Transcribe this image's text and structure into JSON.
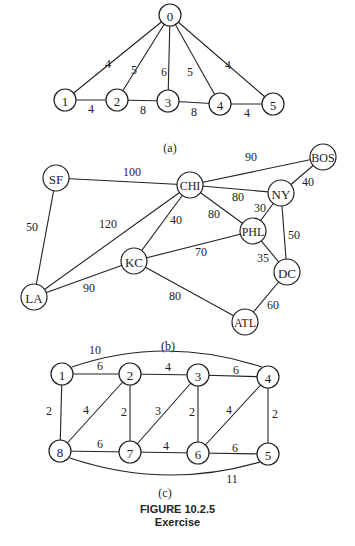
{
  "figure": {
    "title": "FIGURE 10.2.5",
    "subtitle": "Exercise"
  },
  "graph_a": {
    "caption": "(a)",
    "nodes": [
      {
        "id": "0",
        "x": 170,
        "y": 15
      },
      {
        "id": "1",
        "x": 65,
        "y": 100
      },
      {
        "id": "2",
        "x": 117,
        "y": 100
      },
      {
        "id": "3",
        "x": 168,
        "y": 101
      },
      {
        "id": "4",
        "x": 220,
        "y": 104
      },
      {
        "id": "5",
        "x": 273,
        "y": 104
      }
    ],
    "edges": [
      {
        "from": "0",
        "to": "1",
        "w": "4",
        "lx": 108,
        "ly": 64
      },
      {
        "from": "0",
        "to": "2",
        "w": "5",
        "lx": 134,
        "ly": 70
      },
      {
        "from": "0",
        "to": "3",
        "w": "6",
        "lx": 164,
        "ly": 72
      },
      {
        "from": "0",
        "to": "4",
        "w": "5",
        "lx": 190,
        "ly": 72
      },
      {
        "from": "0",
        "to": "5",
        "w": "4",
        "lx": 228,
        "ly": 65
      },
      {
        "from": "1",
        "to": "2",
        "w": "4",
        "lx": 91,
        "ly": 109
      },
      {
        "from": "2",
        "to": "3",
        "w": "8",
        "lx": 143,
        "ly": 110
      },
      {
        "from": "3",
        "to": "4",
        "w": "8",
        "lx": 194,
        "ly": 112
      },
      {
        "from": "4",
        "to": "5",
        "w": "4",
        "lx": 247,
        "ly": 113
      }
    ]
  },
  "graph_b": {
    "caption": "(b)",
    "nodes": [
      {
        "id": "SF",
        "x": 56,
        "y": 178
      },
      {
        "id": "CHI",
        "x": 190,
        "y": 185
      },
      {
        "id": "BOS",
        "x": 323,
        "y": 157
      },
      {
        "id": "NY",
        "x": 281,
        "y": 193
      },
      {
        "id": "PHL",
        "x": 253,
        "y": 231
      },
      {
        "id": "KC",
        "x": 134,
        "y": 261
      },
      {
        "id": "DC",
        "x": 287,
        "y": 272
      },
      {
        "id": "LA",
        "x": 34,
        "y": 297
      },
      {
        "id": "ATL",
        "x": 245,
        "y": 322
      }
    ],
    "edges": [
      {
        "from": "SF",
        "to": "CHI",
        "w": "100",
        "lx": 132,
        "ly": 172
      },
      {
        "from": "SF",
        "to": "LA",
        "w": "50",
        "lx": 32,
        "ly": 227
      },
      {
        "from": "CHI",
        "to": "BOS",
        "w": "90",
        "lx": 251,
        "ly": 157
      },
      {
        "from": "CHI",
        "to": "NY",
        "w": "80",
        "lx": 238,
        "ly": 197
      },
      {
        "from": "CHI",
        "to": "PHL",
        "w": "80",
        "lx": 214,
        "ly": 214
      },
      {
        "from": "CHI",
        "to": "KC",
        "w": "40",
        "lx": 176,
        "ly": 220
      },
      {
        "from": "CHI",
        "to": "LA",
        "w": "120",
        "lx": 108,
        "ly": 224
      },
      {
        "from": "BOS",
        "to": "NY",
        "w": "40",
        "lx": 308,
        "ly": 182
      },
      {
        "from": "NY",
        "to": "PHL",
        "w": "30",
        "lx": 260,
        "ly": 208
      },
      {
        "from": "NY",
        "to": "DC",
        "w": "50",
        "lx": 294,
        "ly": 235
      },
      {
        "from": "PHL",
        "to": "KC",
        "w": "70",
        "lx": 201,
        "ly": 252
      },
      {
        "from": "PHL",
        "to": "DC",
        "w": "35",
        "lx": 263,
        "ly": 258
      },
      {
        "from": "KC",
        "to": "LA",
        "w": "90",
        "lx": 89,
        "ly": 288
      },
      {
        "from": "KC",
        "to": "ATL",
        "w": "80",
        "lx": 175,
        "ly": 296
      },
      {
        "from": "DC",
        "to": "ATL",
        "w": "60",
        "lx": 273,
        "ly": 305
      }
    ]
  },
  "graph_c": {
    "caption": "(c)",
    "nodes": [
      {
        "id": "1",
        "x": 62,
        "y": 374
      },
      {
        "id": "2",
        "x": 130,
        "y": 374
      },
      {
        "id": "3",
        "x": 198,
        "y": 375
      },
      {
        "id": "4",
        "x": 268,
        "y": 377
      },
      {
        "id": "8",
        "x": 60,
        "y": 451
      },
      {
        "id": "7",
        "x": 130,
        "y": 452
      },
      {
        "id": "6",
        "x": 198,
        "y": 453
      },
      {
        "id": "5",
        "x": 268,
        "y": 454
      }
    ],
    "edges": [
      {
        "from": "1",
        "to": "2",
        "w": "6",
        "lx": 100,
        "ly": 366
      },
      {
        "from": "2",
        "to": "3",
        "w": "4",
        "lx": 168,
        "ly": 367
      },
      {
        "from": "3",
        "to": "4",
        "w": "6",
        "lx": 236,
        "ly": 370
      },
      {
        "from": "1",
        "to": "8",
        "w": "2",
        "lx": 49,
        "ly": 411
      },
      {
        "from": "2",
        "to": "8",
        "w": "4",
        "lx": 86,
        "ly": 410
      },
      {
        "from": "2",
        "to": "7",
        "w": "2",
        "lx": 124,
        "ly": 412
      },
      {
        "from": "3",
        "to": "7",
        "w": "3",
        "lx": 158,
        "ly": 411
      },
      {
        "from": "3",
        "to": "6",
        "w": "2",
        "lx": 192,
        "ly": 412
      },
      {
        "from": "4",
        "to": "6",
        "w": "4",
        "lx": 229,
        "ly": 410
      },
      {
        "from": "4",
        "to": "5",
        "w": "2",
        "lx": 275,
        "ly": 414
      },
      {
        "from": "8",
        "to": "7",
        "w": "6",
        "lx": 100,
        "ly": 444
      },
      {
        "from": "7",
        "to": "6",
        "w": "4",
        "lx": 166,
        "ly": 446
      },
      {
        "from": "6",
        "to": "5",
        "w": "6",
        "lx": 235,
        "ly": 448
      }
    ],
    "arcs": [
      {
        "from": "1",
        "to": "4",
        "w": "10",
        "lx": 95,
        "ly": 350,
        "d": "M72,367 Q165,335 262,367"
      },
      {
        "from": "8",
        "to": "5",
        "w": "11",
        "lx": 232,
        "ly": 479,
        "d": "M70,458 Q165,490 260,462"
      }
    ]
  }
}
